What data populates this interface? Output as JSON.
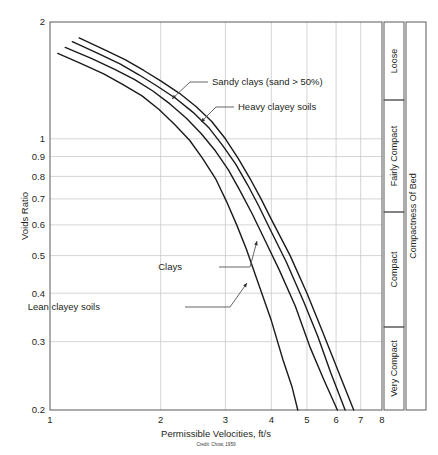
{
  "chart_data": {
    "type": "line",
    "title": "",
    "xlabel": "Permissible Velocities, ft/s",
    "ylabel": "Voids Ratio",
    "xscale": "log",
    "yscale": "log",
    "xlim": [
      1,
      8
    ],
    "ylim": [
      0.2,
      2
    ],
    "grid": true,
    "legend_position": "inline-annotations",
    "xticks": [
      1,
      2,
      3,
      4,
      5,
      6,
      7,
      8
    ],
    "xtick_labels": [
      "1",
      "2",
      "3",
      "4",
      "5",
      "6",
      "7",
      "8"
    ],
    "yticks": [
      0.2,
      0.3,
      0.4,
      0.5,
      0.6,
      0.7,
      0.8,
      0.9,
      1,
      2
    ],
    "ytick_labels": [
      "0.2",
      "0.3",
      "0.4",
      "0.5",
      "0.6",
      "0.7",
      "0.8",
      "0.9",
      "1",
      "2"
    ],
    "credit": "Credit: Chow, 1959",
    "series": [
      {
        "name": "Sandy clays (sand > 50%)",
        "points": [
          [
            1.2,
            1.82
          ],
          [
            1.4,
            1.7
          ],
          [
            1.6,
            1.6
          ],
          [
            1.8,
            1.5
          ],
          [
            2.0,
            1.41
          ],
          [
            2.25,
            1.31
          ],
          [
            2.5,
            1.21
          ],
          [
            2.75,
            1.11
          ],
          [
            3.0,
            1.0
          ],
          [
            3.25,
            0.89
          ],
          [
            3.5,
            0.79
          ],
          [
            3.75,
            0.7
          ],
          [
            4.0,
            0.62
          ],
          [
            4.5,
            0.5
          ],
          [
            5.0,
            0.4
          ],
          [
            5.5,
            0.32
          ],
          [
            6.0,
            0.26
          ],
          [
            6.7,
            0.2
          ]
        ]
      },
      {
        "name": "Heavy clayey soils",
        "points": [
          [
            1.15,
            1.78
          ],
          [
            1.35,
            1.66
          ],
          [
            1.55,
            1.56
          ],
          [
            1.75,
            1.46
          ],
          [
            1.95,
            1.37
          ],
          [
            2.2,
            1.27
          ],
          [
            2.45,
            1.17
          ],
          [
            2.7,
            1.07
          ],
          [
            2.95,
            0.96
          ],
          [
            3.2,
            0.86
          ],
          [
            3.45,
            0.76
          ],
          [
            3.7,
            0.67
          ],
          [
            3.95,
            0.59
          ],
          [
            4.4,
            0.48
          ],
          [
            4.9,
            0.38
          ],
          [
            5.35,
            0.31
          ],
          [
            5.8,
            0.25
          ],
          [
            6.35,
            0.2
          ]
        ]
      },
      {
        "name": "Clays",
        "points": [
          [
            1.1,
            1.72
          ],
          [
            1.3,
            1.61
          ],
          [
            1.5,
            1.51
          ],
          [
            1.7,
            1.42
          ],
          [
            1.9,
            1.33
          ],
          [
            2.12,
            1.23
          ],
          [
            2.35,
            1.13
          ],
          [
            2.58,
            1.03
          ],
          [
            2.82,
            0.93
          ],
          [
            3.06,
            0.83
          ],
          [
            3.3,
            0.73
          ],
          [
            3.55,
            0.64
          ],
          [
            3.8,
            0.56
          ],
          [
            4.2,
            0.46
          ],
          [
            4.65,
            0.37
          ],
          [
            5.1,
            0.29
          ],
          [
            5.55,
            0.24
          ],
          [
            6.05,
            0.2
          ]
        ]
      },
      {
        "name": "Lean clayey soils",
        "points": [
          [
            1.05,
            1.66
          ],
          [
            1.22,
            1.56
          ],
          [
            1.4,
            1.47
          ],
          [
            1.58,
            1.38
          ],
          [
            1.78,
            1.29
          ],
          [
            1.98,
            1.19
          ],
          [
            2.18,
            1.09
          ],
          [
            2.4,
            0.99
          ],
          [
            2.6,
            0.89
          ],
          [
            2.82,
            0.79
          ],
          [
            3.02,
            0.69
          ],
          [
            3.22,
            0.6
          ],
          [
            3.42,
            0.52
          ],
          [
            3.7,
            0.42
          ],
          [
            4.0,
            0.34
          ],
          [
            4.3,
            0.27
          ],
          [
            4.55,
            0.23
          ],
          [
            4.72,
            0.2
          ]
        ]
      }
    ],
    "annotations": [
      {
        "label": "Sandy clays (sand > 50%)",
        "text_x": 212,
        "text_y": 85,
        "leader": [
          [
            208,
            82
          ],
          [
            190,
            82
          ],
          [
            172,
            99
          ]
        ]
      },
      {
        "label": "Heavy clayey soils",
        "text_x": 238,
        "text_y": 110,
        "leader": [
          [
            234,
            107
          ],
          [
            216,
            107
          ],
          [
            201,
            122
          ]
        ]
      },
      {
        "label": "Clays",
        "text_x": 182,
        "text_y": 270,
        "leader": [
          [
            219,
            267
          ],
          [
            250,
            267
          ],
          [
            257,
            241
          ]
        ]
      },
      {
        "label": "Lean clayey soils",
        "text_x": 100,
        "text_y": 310,
        "leader": [
          [
            185,
            307
          ],
          [
            230,
            307
          ],
          [
            247,
            283
          ]
        ]
      }
    ],
    "compactness": {
      "axis_label": "Compactness Of Bed",
      "bands": [
        {
          "label": "Loose",
          "top": 22,
          "bottom": 100
        },
        {
          "label": "Fairly Compact",
          "top": 100,
          "bottom": 212
        },
        {
          "label": "Compact",
          "top": 212,
          "bottom": 327
        },
        {
          "label": "Very Compact",
          "top": 327,
          "bottom": 410
        }
      ]
    }
  }
}
